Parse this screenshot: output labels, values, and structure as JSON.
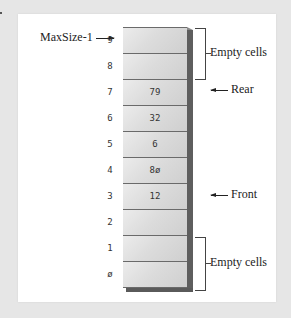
{
  "diagram": {
    "cells": [
      {
        "index": "9",
        "value": ""
      },
      {
        "index": "8",
        "value": ""
      },
      {
        "index": "7",
        "value": "79"
      },
      {
        "index": "6",
        "value": "32"
      },
      {
        "index": "5",
        "value": "6"
      },
      {
        "index": "4",
        "value": "8ø"
      },
      {
        "index": "3",
        "value": "12"
      },
      {
        "index": "2",
        "value": ""
      },
      {
        "index": "1",
        "value": ""
      },
      {
        "index": "ø",
        "value": ""
      }
    ],
    "labels": {
      "maxsize": "MaxSize-1",
      "rear": "Rear",
      "front": "Front",
      "empty_top": "Empty cells",
      "empty_bottom": "Empty cells"
    },
    "colors": {
      "background": "#e6e6e6",
      "panel": "#ffffff",
      "cell_fill": "#dcdcdc",
      "cell_shadow": "#5e5e5e",
      "line": "#444444"
    }
  }
}
